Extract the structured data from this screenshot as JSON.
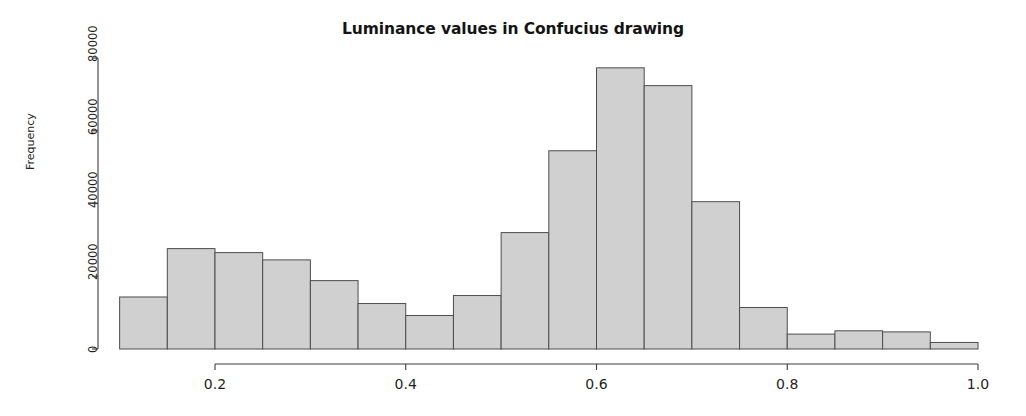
{
  "chart_data": {
    "type": "bar",
    "subtype": "histogram",
    "title": "Luminance values in Confucius drawing",
    "xlabel": "",
    "ylabel": "Frequency",
    "xlim": [
      0.06,
      1.03
    ],
    "ylim": [
      0,
      82000
    ],
    "grid": false,
    "legend": null,
    "bin_width": 0.05,
    "bin_edges": [
      0.1,
      0.15,
      0.2,
      0.25,
      0.3,
      0.35,
      0.4,
      0.45,
      0.5,
      0.55,
      0.6,
      0.65,
      0.7,
      0.75,
      0.8,
      0.85,
      0.9,
      0.95,
      1.0
    ],
    "categories": [
      "0.10-0.15",
      "0.15-0.20",
      "0.20-0.25",
      "0.25-0.30",
      "0.30-0.35",
      "0.35-0.40",
      "0.40-0.45",
      "0.45-0.50",
      "0.50-0.55",
      "0.55-0.60",
      "0.60-0.65",
      "0.65-0.70",
      "0.70-0.75",
      "0.75-0.80",
      "0.80-0.85",
      "0.85-0.90",
      "0.90-0.95",
      "0.95-1.00"
    ],
    "values": [
      14300,
      27600,
      26500,
      24500,
      18800,
      12500,
      9200,
      14700,
      32000,
      54500,
      77300,
      72400,
      40500,
      11400,
      4100,
      5000,
      4700,
      1800
    ],
    "bar_fill_color": "#d0d0d0",
    "bar_edge_color": "#4d4d4d",
    "axis_color": "#3c3c3c",
    "xticks": [
      {
        "value": 0.2,
        "label": "0.2"
      },
      {
        "value": 0.4,
        "label": "0.4"
      },
      {
        "value": 0.6,
        "label": "0.6"
      },
      {
        "value": 0.8,
        "label": "0.8"
      },
      {
        "value": 1.0,
        "label": "1.0"
      }
    ],
    "yticks": [
      {
        "value": 0,
        "label": "0"
      },
      {
        "value": 20000,
        "label": "20000"
      },
      {
        "value": 40000,
        "label": "40000"
      },
      {
        "value": 60000,
        "label": "60000"
      },
      {
        "value": 80000,
        "label": "80000"
      }
    ]
  }
}
